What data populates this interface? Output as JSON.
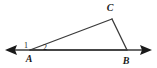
{
  "figure": {
    "kind": "geometry-diagram",
    "background_color": "#ffffff",
    "stroke_color": "#3a3a3a",
    "label_color": "#1a1a1a",
    "width": 157,
    "height": 68
  },
  "vertices": {
    "A": {
      "label": "A",
      "x": 30,
      "y": 50,
      "label_x": 29,
      "label_y": 62
    },
    "B": {
      "label": "B",
      "x": 127,
      "y": 50,
      "label_x": 126,
      "label_y": 64
    },
    "C": {
      "label": "C",
      "x": 112,
      "y": 19,
      "label_x": 110,
      "label_y": 10
    }
  },
  "angles": [
    {
      "name": "1",
      "label": "1",
      "location": "exterior-at-A-left",
      "label_x": 26,
      "label_y": 48
    },
    {
      "name": "2",
      "label": "2",
      "location": "interior-at-A",
      "label_x": 45,
      "label_y": 50
    }
  ],
  "segments": [
    {
      "name": "AC",
      "from": "A",
      "to": "C"
    },
    {
      "name": "CB",
      "from": "C",
      "to": "B"
    },
    {
      "name": "AB",
      "from": "A",
      "to": "B"
    }
  ],
  "line": {
    "name": "line-through-A-and-B",
    "left_end_x": 6,
    "right_end_x": 151,
    "y": 50,
    "left_arrow": "arrow-left",
    "right_arrow": "arrow-right"
  }
}
